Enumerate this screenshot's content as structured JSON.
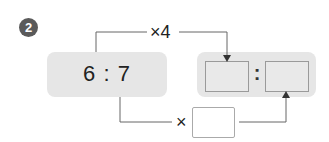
{
  "problem": {
    "number": "2",
    "left_ratio": "6 : 7",
    "right_ratio_separator": ":",
    "top_operation": "×4",
    "bottom_operation": "×",
    "right_first_term": "",
    "right_second_term": "",
    "multiplier_blank": ""
  },
  "colors": {
    "box_fill": "#e6e6e6",
    "line": "#555555",
    "badge": "#5a5a5a"
  }
}
